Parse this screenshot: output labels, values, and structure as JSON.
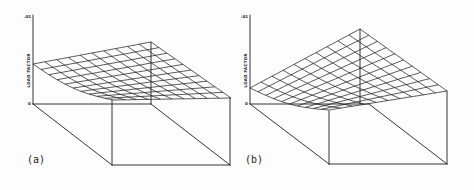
{
  "figure": {
    "panels": [
      {
        "id": "a",
        "label": "(a)",
        "axis": {
          "label": "LOAD FACTOR",
          "top_tick": ".01",
          "bottom_tick": "0"
        },
        "geometry": {
          "axis_x": 33,
          "axis_top": 15,
          "axis_base": 104,
          "surface": {
            "left": [
              33,
              64
            ],
            "back": [
              151,
              42
            ],
            "right": [
              231,
              98
            ],
            "front": [
              113,
              100
            ],
            "sag": [
              0,
              6
            ]
          },
          "box": {
            "back_left": [
              33,
              104
            ],
            "back_mid": [
              151,
              104
            ],
            "front_left_top": [
              112,
              100
            ],
            "front_left_bottom": [
              112,
              165
            ],
            "front_right_top": [
              230,
              98
            ],
            "front_right_bottom": [
              230,
              165
            ]
          },
          "grid": 10,
          "label_pos": [
            27,
            163
          ]
        }
      },
      {
        "id": "b",
        "label": "(b)",
        "axis": {
          "label": "LOAD FACTOR",
          "top_tick": ".01",
          "bottom_tick": "0"
        },
        "geometry": {
          "axis_x": 250,
          "axis_top": 15,
          "axis_base": 104,
          "surface": {
            "left": [
              250,
              88
            ],
            "back": [
              360,
              29
            ],
            "right": [
              447,
              91
            ],
            "front": [
              329,
              110
            ],
            "sag": [
              0,
              5
            ]
          },
          "box": {
            "back_left": [
              250,
              104
            ],
            "back_mid": [
              369,
              104
            ],
            "front_left_top": [
              329,
              111
            ],
            "front_left_bottom": [
              329,
              164
            ],
            "front_right_top": [
              447,
              91
            ],
            "front_right_bottom": [
              447,
              164
            ]
          },
          "grid": 10,
          "label_pos": [
            245,
            163
          ]
        }
      }
    ]
  },
  "chart_data": [
    {
      "type": "surface",
      "title": "(a)",
      "zlabel": "LOAD FACTOR",
      "zlim": [
        0,
        0.01
      ],
      "z_ticks": [
        "0",
        ".01"
      ],
      "grid": "10x10 wireframe",
      "description": "Load factor surface rising toward the back corner; left edge near mid-height, front corner near zero"
    },
    {
      "type": "surface",
      "title": "(b)",
      "zlabel": "LOAD FACTOR",
      "zlim": [
        0,
        0.01
      ],
      "z_ticks": [
        "0",
        ".01"
      ],
      "grid": "10x10 wireframe",
      "description": "Load factor surface rising steeply toward the back corner; left edge low, front corner near zero"
    }
  ]
}
